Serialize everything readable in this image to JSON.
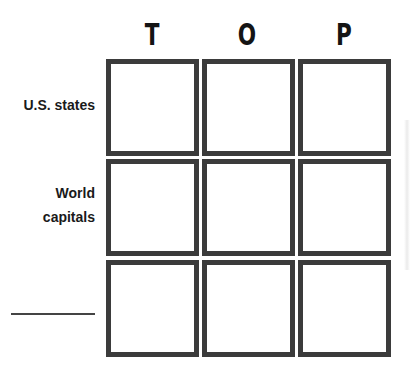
{
  "worksheet": {
    "column_headers": [
      "T",
      "O",
      "P"
    ],
    "row_labels": [
      {
        "lines": [
          "U.S. states"
        ]
      },
      {
        "lines": [
          "World",
          "capitals"
        ]
      },
      {
        "lines": [],
        "blank_line": true
      }
    ],
    "grid": {
      "rows": 3,
      "columns": 3,
      "cells": [
        [
          "",
          "",
          ""
        ],
        [
          "",
          "",
          ""
        ],
        [
          "",
          "",
          ""
        ]
      ]
    },
    "colors": {
      "border": "#3b3b3b",
      "text": "#141414",
      "background": "#ffffff"
    }
  }
}
